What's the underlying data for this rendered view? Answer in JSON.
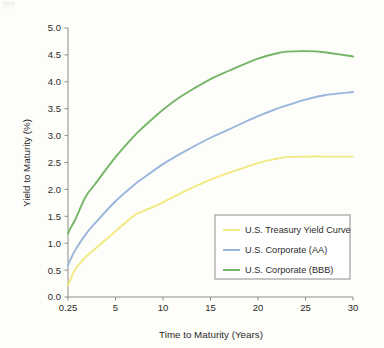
{
  "chart_data": {
    "type": "line",
    "title": "",
    "xlabel": "Time to Maturity (Years)",
    "ylabel": "Yield to Maturity (%)",
    "xlim": [
      0.25,
      30
    ],
    "ylim": [
      0.0,
      5.0
    ],
    "grid": false,
    "legend_position": "lower-right-inside",
    "x_tick_labels": [
      "0.25",
      "5",
      "10",
      "15",
      "20",
      "25",
      "30"
    ],
    "x_tick_values": [
      0.25,
      5,
      10,
      15,
      20,
      25,
      30
    ],
    "y_tick_labels": [
      "0.0",
      "0.5",
      "1.0",
      "1.5",
      "2.0",
      "2.5",
      "3.0",
      "3.5",
      "4.0",
      "4.5",
      "5.0"
    ],
    "y_tick_values": [
      0.0,
      0.5,
      1.0,
      1.5,
      2.0,
      2.5,
      3.0,
      3.5,
      4.0,
      4.5,
      5.0
    ],
    "x": [
      0.25,
      0.5,
      1,
      2,
      3,
      5,
      7,
      8,
      10,
      12,
      15,
      17,
      20,
      22,
      23,
      25,
      27,
      30
    ],
    "series": [
      {
        "name": "U.S. Treasury Yield Curve",
        "color": "#f2ea7e",
        "values": [
          0.21,
          0.33,
          0.52,
          0.74,
          0.9,
          1.22,
          1.52,
          1.6,
          1.76,
          1.94,
          2.18,
          2.31,
          2.49,
          2.57,
          2.6,
          2.61,
          2.61,
          2.61
        ]
      },
      {
        "name": "U.S. Corporate (AA)",
        "color": "#9ab6dd",
        "values": [
          0.59,
          0.7,
          0.88,
          1.16,
          1.38,
          1.78,
          2.09,
          2.22,
          2.47,
          2.68,
          2.96,
          3.12,
          3.36,
          3.5,
          3.56,
          3.67,
          3.75,
          3.81
        ]
      },
      {
        "name": "U.S. Corporate (BBB)",
        "color": "#74b566",
        "values": [
          1.18,
          1.28,
          1.45,
          1.86,
          2.11,
          2.6,
          3.0,
          3.17,
          3.48,
          3.74,
          4.05,
          4.21,
          4.43,
          4.53,
          4.56,
          4.57,
          4.55,
          4.47
        ]
      }
    ]
  },
  "legend": {
    "items": [
      {
        "label": "U.S. Treasury Yield Curve"
      },
      {
        "label": "U.S. Corporate (AA)"
      },
      {
        "label": "U.S. Corporate (BBB)"
      }
    ]
  },
  "axes": {
    "x_title": "Time to Maturity (Years)",
    "y_title": "Yield to Maturity (%)"
  }
}
